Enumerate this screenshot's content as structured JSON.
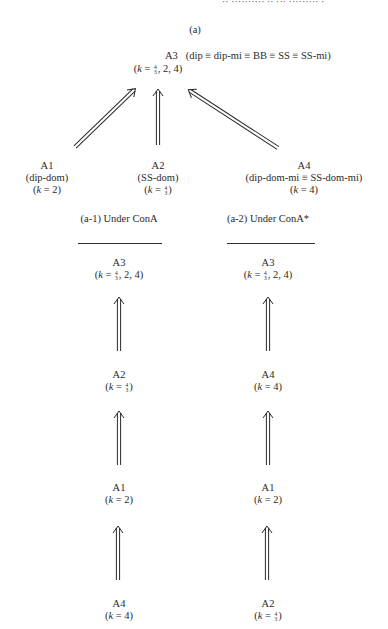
{
  "header": {
    "text": "··  ·········· ·· ··· ········· ·"
  },
  "panel_a": {
    "title": "(a)",
    "top": {
      "node": "A3",
      "equiv": "(dip ≡ dip-mi ≡ BB ≡ SS ≡ SS-mi)",
      "k_prefix": "(k = ",
      "k_frac_num": "4",
      "k_frac_den": "3",
      "k_suffix": ", 2, 4)"
    },
    "children": [
      {
        "node": "A1",
        "desc": "(dip-dom)",
        "k": "(k = 2)"
      },
      {
        "node": "A2",
        "desc": "(SS-dom)",
        "k_prefix": "(k = ",
        "k_frac_num": "4",
        "k_frac_den": "3",
        "k_suffix": ")"
      },
      {
        "node": "A4",
        "desc": "(dip-dom-mi ≡ SS-dom-mi)",
        "k": "(k = 4)"
      }
    ]
  },
  "panel_a1": {
    "title": "(a-1) Under ConA",
    "chain": [
      {
        "node": "A3",
        "k_prefix": "(k = ",
        "k_frac_num": "4",
        "k_frac_den": "3",
        "k_suffix": ", 2, 4)"
      },
      {
        "node": "A2",
        "k_prefix": "(k = ",
        "k_frac_num": "4",
        "k_frac_den": "3",
        "k_suffix": ")"
      },
      {
        "node": "A1",
        "k": "(k = 2)"
      },
      {
        "node": "A4",
        "k": "(k = 4)"
      }
    ]
  },
  "panel_a2": {
    "title": "(a-2) Under ConA*",
    "chain": [
      {
        "node": "A3",
        "k_prefix": "(k = ",
        "k_frac_num": "4",
        "k_frac_den": "3",
        "k_suffix": ", 2, 4)"
      },
      {
        "node": "A4",
        "k": "(k = 4)"
      },
      {
        "node": "A1",
        "k": "(k = 2)"
      },
      {
        "node": "A2",
        "k_prefix": "(k = ",
        "k_frac_num": "4",
        "k_frac_den": "3",
        "k_suffix": ")"
      }
    ]
  },
  "colors": {
    "ink": "#2a2a2a",
    "background": "#ffffff"
  }
}
